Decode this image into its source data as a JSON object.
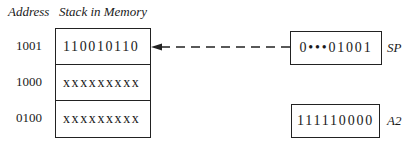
{
  "headers": {
    "address": "Address",
    "stack": "Stack in Memory"
  },
  "stack_rows": [
    {
      "address": "1001",
      "value": "110010110"
    },
    {
      "address": "1000",
      "value": "xxxxxxxxx"
    },
    {
      "address": "0100",
      "value": "xxxxxxxxx"
    }
  ],
  "registers": {
    "sp": {
      "label": "SP",
      "value": "0•••01001"
    },
    "a2": {
      "label": "A2",
      "value": "111110000"
    }
  },
  "arrow": {
    "from": "SP",
    "to": "1001",
    "style": "dashed"
  }
}
